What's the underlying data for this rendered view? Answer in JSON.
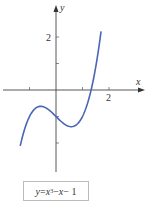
{
  "chart_data": {
    "type": "line",
    "title": "",
    "xlabel": "x",
    "ylabel": "y",
    "equation": "y = x^3 - x - 1",
    "x_ticks": [
      -1,
      1,
      2
    ],
    "x_tick_labels": [
      {
        "value": 2,
        "label": "2"
      }
    ],
    "y_ticks": [
      -2,
      -1,
      1,
      2
    ],
    "y_tick_labels": [
      {
        "value": 2,
        "label": "2"
      }
    ],
    "xlim": [
      -2.1,
      3.4
    ],
    "ylim": [
      -4.3,
      3.4
    ],
    "grid": false,
    "series": [
      {
        "name": "y = x^3 - x - 1",
        "color": "#4a66b5",
        "x": [
          -1.35,
          -1.2,
          -1.0,
          -0.8,
          -0.577,
          -0.4,
          -0.2,
          0.0,
          0.2,
          0.4,
          0.577,
          0.8,
          1.0,
          1.2,
          1.325,
          1.5,
          1.7
        ],
        "y": [
          -2.11,
          -1.53,
          -1.0,
          -0.71,
          -0.62,
          -0.66,
          -0.81,
          -1.0,
          -1.19,
          -1.34,
          -1.38,
          -1.29,
          -1.0,
          -0.47,
          0.0,
          0.88,
          2.21
        ]
      }
    ]
  },
  "labels": {
    "x_axis": "x",
    "y_axis": "y",
    "x_tick_2": "2",
    "y_tick_2": "2"
  },
  "legend": {
    "y": "y",
    "eq": " = ",
    "x1": "x",
    "exp": "3",
    "rest1": " − ",
    "x2": "x",
    "rest2": " − 1"
  }
}
